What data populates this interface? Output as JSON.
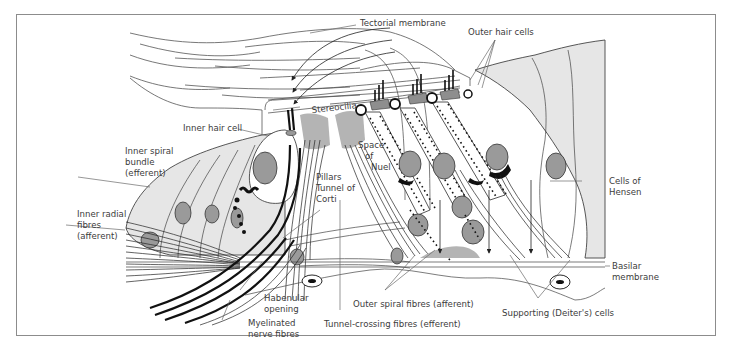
{
  "figure": {
    "type": "anatomical-diagram",
    "colors": {
      "frame_border": "#8c8c8c",
      "cell_fill": "#e6e6e6",
      "nucleus_fill": "#9a9a9a",
      "label_text": "#3c3c3c",
      "line": "#222222"
    }
  },
  "labels": {
    "tectorial_membrane": "Tectorial membrane",
    "outer_hair_cells": "Outer hair cells",
    "stereocilia": "Stereocilia",
    "inner_hair_cell": "Inner hair cell",
    "inner_spiral_bundle": [
      "Inner spiral",
      "bundle",
      "(efferent)"
    ],
    "space_of_nuel": [
      "Space",
      "of",
      "Nuel"
    ],
    "pillars": "Pillars",
    "tunnel_of_corti": [
      "Tunnel of",
      "Corti"
    ],
    "cells_of_hensen": [
      "Cells of",
      "Hensen"
    ],
    "inner_radial_fibres": [
      "Inner radial",
      "fibres",
      "(afferent)"
    ],
    "basilar_membrane": [
      "Basilar",
      "membrane"
    ],
    "habenular_opening": [
      "Habenular",
      "opening"
    ],
    "outer_spiral_fibres": "Outer spiral fibres (afferent)",
    "myelinated_nerve_fibres": [
      "Myelinated",
      "nerve fibres"
    ],
    "tunnel_crossing_fibres": "Tunnel-crossing fibres (efferent)",
    "supporting_cells": "Supporting (Deiter's) cells"
  }
}
